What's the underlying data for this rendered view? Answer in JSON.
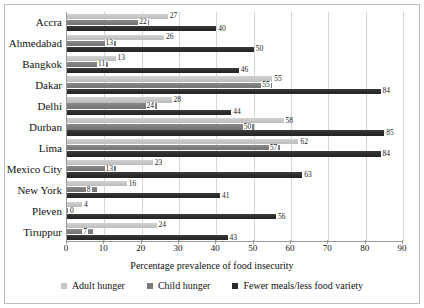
{
  "chart_data": {
    "type": "bar",
    "orientation": "horizontal",
    "title": "",
    "xlabel": "Percentage prevalence of food insecurity",
    "ylabel": "",
    "xlim": [
      0,
      90
    ],
    "xticks": [
      0,
      10,
      20,
      30,
      40,
      50,
      60,
      70,
      80,
      90
    ],
    "grid": true,
    "legend_position": "bottom",
    "categories": [
      "Accra",
      "Ahmedabad",
      "Bangkok",
      "Dakar",
      "Delhi",
      "Durban",
      "Lima",
      "Mexico City",
      "New York",
      "Pleven",
      "Tiruppur"
    ],
    "series": [
      {
        "name": "Adult hunger",
        "color": "#c6c6c6",
        "values": [
          27,
          26,
          13,
          55,
          28,
          58,
          62,
          23,
          16,
          4,
          24
        ]
      },
      {
        "name": "Child hunger",
        "color": "#7c7c7c",
        "values": [
          22,
          13,
          11,
          55,
          24,
          50,
          57,
          13,
          8,
          0,
          7
        ]
      },
      {
        "name": "Fewer meals/less food variety",
        "color": "#2b2b2b",
        "values": [
          40,
          50,
          46,
          84,
          44,
          85,
          84,
          63,
          41,
          56,
          43
        ]
      }
    ]
  },
  "legend": {
    "items": [
      {
        "label": "Adult hunger",
        "swatch_class": "sw-adult"
      },
      {
        "label": "Child hunger",
        "swatch_class": "sw-child"
      },
      {
        "label": "Fewer meals/less food variety",
        "swatch_class": "sw-meals"
      }
    ]
  }
}
